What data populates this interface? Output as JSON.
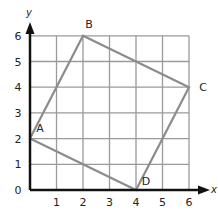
{
  "figure": {
    "x_axis_label": "x",
    "y_axis_label": "y",
    "x_ticks": [
      "1",
      "2",
      "3",
      "4",
      "5",
      "6"
    ],
    "y_ticks": [
      "0",
      "1",
      "2",
      "3",
      "4",
      "5",
      "6"
    ],
    "grid": {
      "xmin": 0,
      "xmax": 6,
      "ymin": 0,
      "ymax": 6
    },
    "points": [
      {
        "label": "A",
        "x": 0,
        "y": 2
      },
      {
        "label": "B",
        "x": 2,
        "y": 6
      },
      {
        "label": "C",
        "x": 6,
        "y": 4
      },
      {
        "label": "D",
        "x": 4,
        "y": 0
      }
    ],
    "colors": {
      "grid": "#9a9a9a",
      "axes": "#111111",
      "polygon": "#8c8c8c"
    }
  }
}
